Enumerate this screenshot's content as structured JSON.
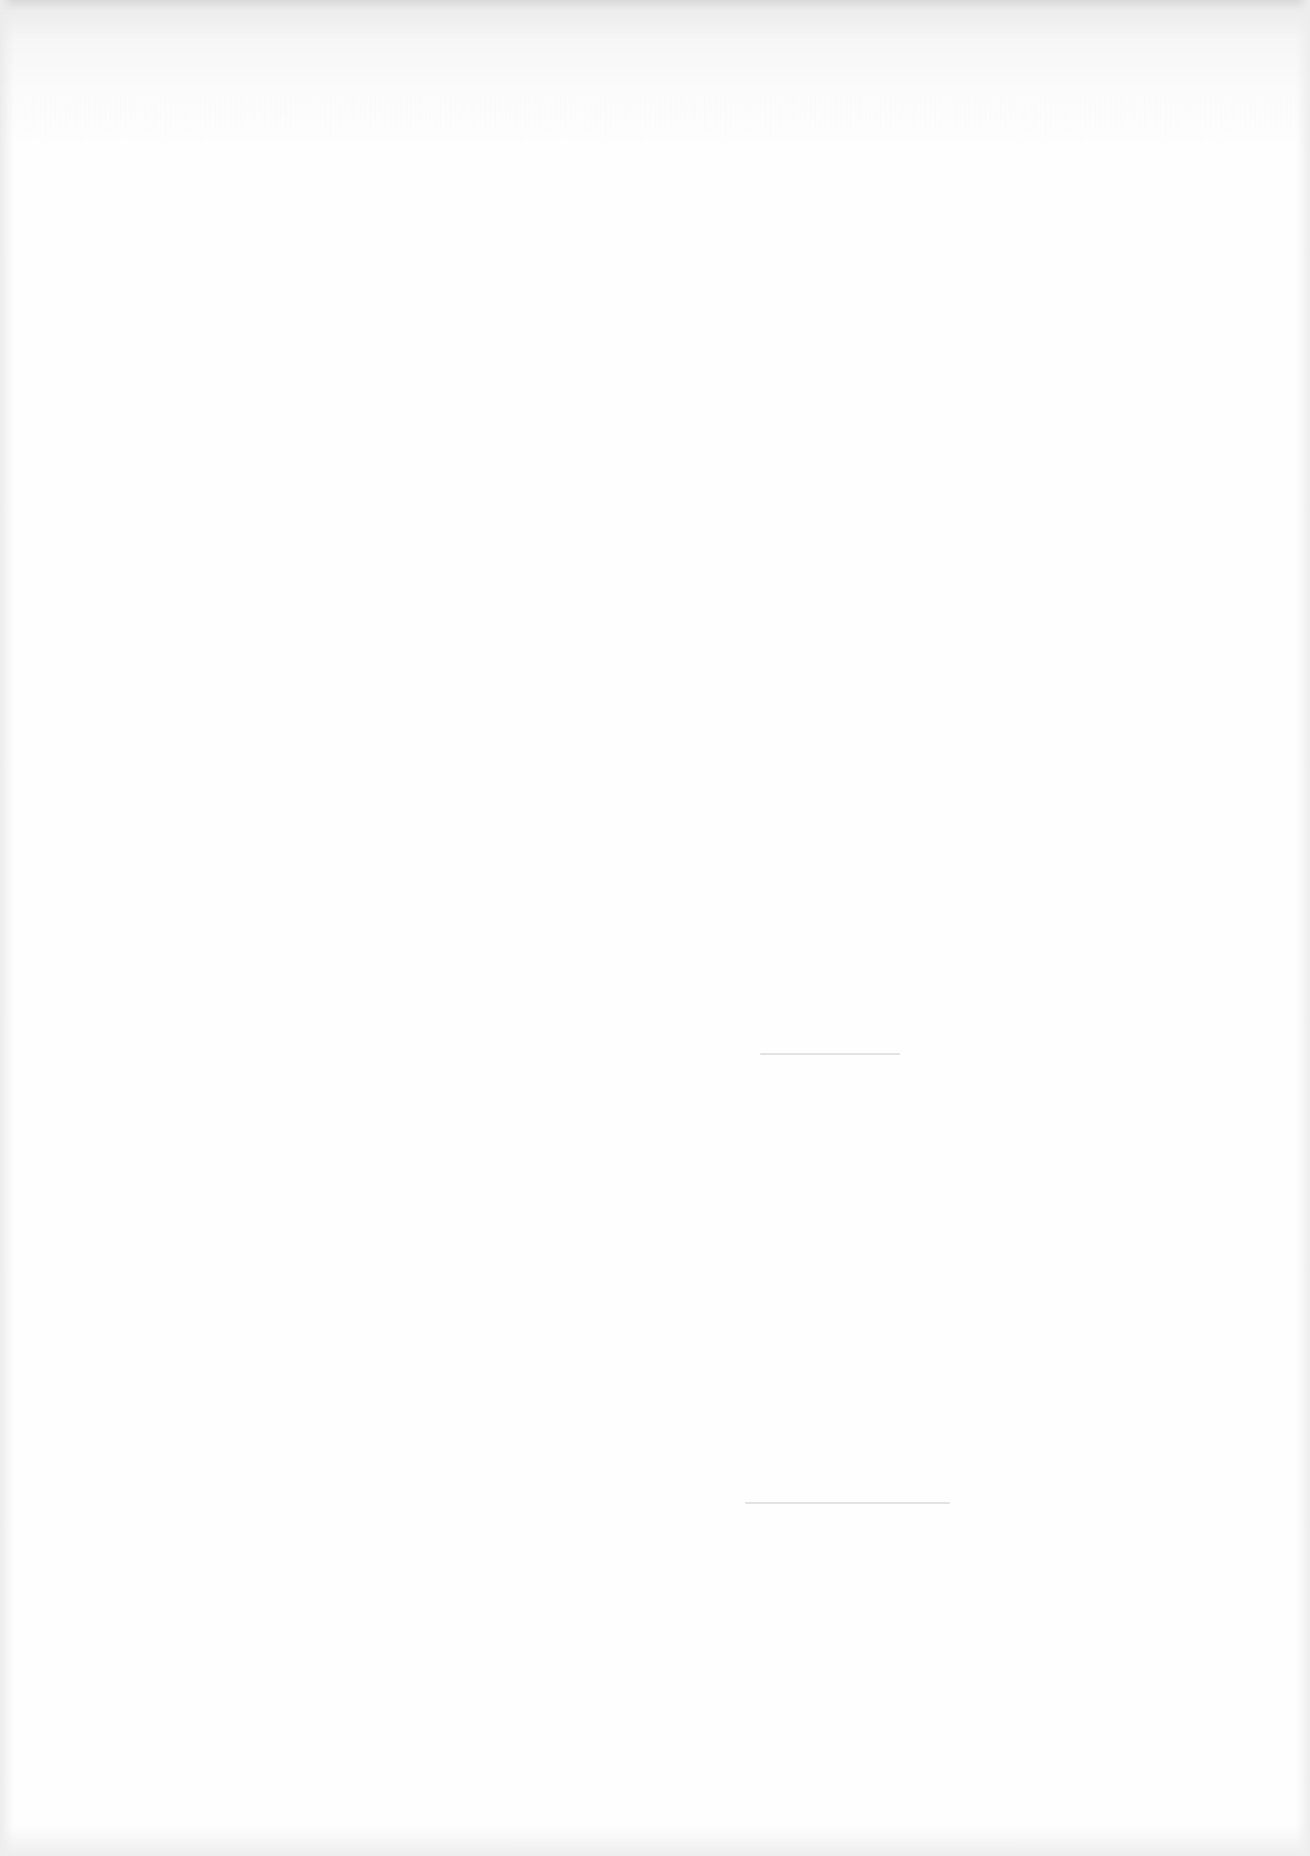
{
  "page": {
    "type": "blank-scanned-page",
    "visible_text": ""
  },
  "marks": [
    {
      "name": "faint-line-mid",
      "x": 760,
      "y": 1053,
      "width": 140
    },
    {
      "name": "faint-line-lower",
      "x": 745,
      "y": 1502,
      "width": 205
    }
  ]
}
